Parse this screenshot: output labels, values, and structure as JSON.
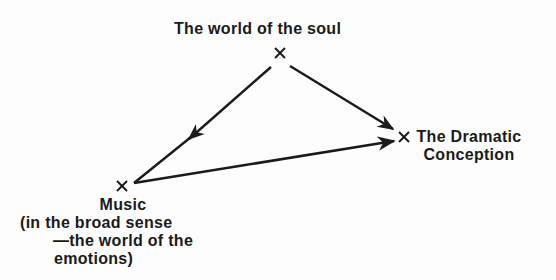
{
  "nodes": {
    "soul": {
      "label": "The world of the soul"
    },
    "drama": {
      "line1": "The Dramatic",
      "line2": "Conception"
    },
    "music": {
      "line1": "Music",
      "line2": "(in the broad sense",
      "line3": "—the world of the",
      "line4": "emotions)"
    }
  },
  "edges": [
    {
      "from": "soul",
      "to": "music",
      "arrow": "mid"
    },
    {
      "from": "soul",
      "to": "drama",
      "arrow": "end"
    },
    {
      "from": "music",
      "to": "drama",
      "arrow": "end"
    }
  ],
  "colors": {
    "ink": "#1a1a1a",
    "background": "#fdfdfd"
  }
}
